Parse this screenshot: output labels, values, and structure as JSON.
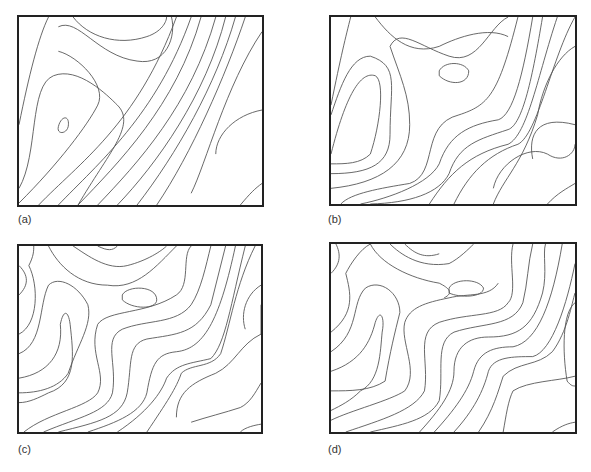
{
  "figure": {
    "panels": [
      {
        "id": "a",
        "label": "(a)",
        "description": "smooth contour map, low detail"
      },
      {
        "id": "b",
        "label": "(b)",
        "description": "contour map, moderate detail"
      },
      {
        "id": "c",
        "label": "(c)",
        "description": "contour map, high detail"
      },
      {
        "id": "d",
        "label": "(d)",
        "description": "contour map, high detail variant"
      }
    ],
    "colors": {
      "frame": "#222222",
      "contour": "#555555",
      "background": "#ffffff"
    }
  }
}
